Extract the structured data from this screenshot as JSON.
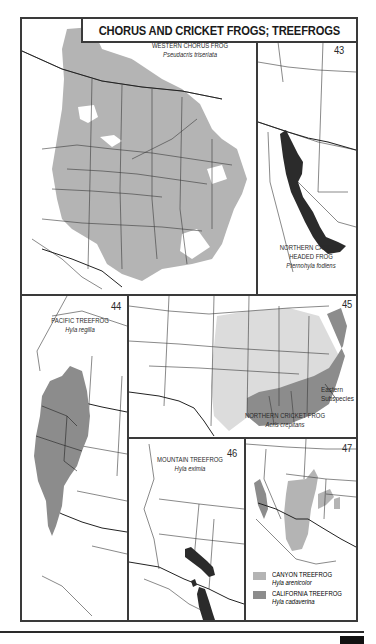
{
  "title": "CHORUS AND CRICKET FROGS; TREEFROGS",
  "colors": {
    "range_light": "#b4b4b4",
    "range_medium": "#8c8c8c",
    "range_dark": "#2b2b2b",
    "range_pale": "#dcdcdc",
    "border": "#3a3a3a"
  },
  "maps": [
    {
      "number": "42",
      "common_name": "WESTERN CHORUS FROG",
      "scientific_name": "Pseudacris triseriata"
    },
    {
      "number": "43",
      "common_name_line1": "NORTHERN CASQUE-",
      "common_name_line2": "HEADED FROG",
      "scientific_name": "Pternohyla fodiens"
    },
    {
      "number": "44",
      "common_name": "PACIFIC TREEFROG",
      "scientific_name": "Hyla regilla"
    },
    {
      "number": "45",
      "common_name": "NORTHERN CRICKET FROG",
      "scientific_name": "Acris crepitans",
      "annotation_line1": "Eastern",
      "annotation_line2": "Subspecies"
    },
    {
      "number": "46",
      "common_name": "MOUNTAIN TREEFROG",
      "scientific_name": "Hyla eximia"
    },
    {
      "number": "47",
      "legend": [
        {
          "common_name": "CANYON TREEFROG",
          "scientific_name": "Hyla arenicolor",
          "color": "#b4b4b4"
        },
        {
          "common_name": "CALIFORNIA TREEFROG",
          "scientific_name": "Hyla cadaverina",
          "color": "#8c8c8c"
        }
      ]
    }
  ]
}
